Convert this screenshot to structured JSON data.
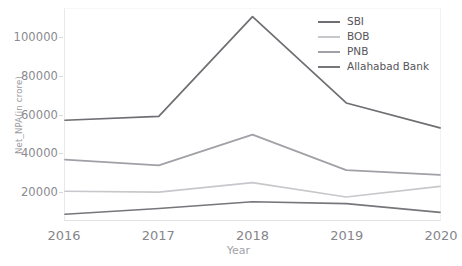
{
  "chart_data": {
    "type": "line",
    "title": "",
    "xlabel": "Year",
    "ylabel": "Net_NPA(in crore)",
    "categories": [
      "2016",
      "2017",
      "2018",
      "2019",
      "2020"
    ],
    "x": [
      2016,
      2017,
      2018,
      2019,
      2020
    ],
    "xlim": [
      2016,
      2020
    ],
    "ylim": [
      5000,
      115000
    ],
    "yticks": [
      20000,
      40000,
      60000,
      80000,
      100000
    ],
    "ytick_labels": [
      "20000",
      "40000",
      "60000",
      "80000",
      "100000"
    ],
    "xtick_labels": [
      "2016",
      "2017",
      "2018",
      "2019",
      "2020"
    ],
    "grid": false,
    "legend_position": "top-right",
    "series": [
      {
        "name": "SBI",
        "color": "#6e6e73",
        "values": [
          57000,
          59000,
          111000,
          66000,
          53000
        ]
      },
      {
        "name": "BOB",
        "color": "#c8c8cc",
        "values": [
          20000,
          19500,
          24500,
          17000,
          22500
        ]
      },
      {
        "name": "PNB",
        "color": "#a0a0a6",
        "values": [
          36500,
          33500,
          49500,
          31000,
          28500
        ]
      },
      {
        "name": "Allahabad Bank",
        "color": "#76767b",
        "values": [
          8000,
          11000,
          14500,
          13500,
          9000
        ]
      }
    ]
  },
  "legend": {
    "items": [
      {
        "label": "SBI"
      },
      {
        "label": "BOB"
      },
      {
        "label": "PNB"
      },
      {
        "label": "Allahabad Bank"
      }
    ]
  },
  "axes": {
    "x_title": "Year",
    "y_title": "Net_NPA(in crore)"
  }
}
